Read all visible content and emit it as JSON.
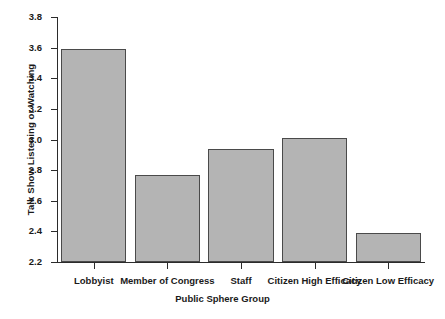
{
  "chart_data": {
    "type": "bar",
    "title": "",
    "xlabel": "Public Sphere Group",
    "ylabel": "Talk Show Listening or Watching",
    "categories": [
      "Lobbyist",
      "Member of Congress",
      "Staff",
      "Citizen High Efficacy",
      "Citizen Low Efficacy"
    ],
    "values": [
      3.59,
      2.77,
      2.94,
      3.01,
      2.39
    ],
    "ylim": [
      2.2,
      3.8
    ],
    "yticks": [
      "2.2",
      "2.4",
      "2.6",
      "2.8",
      "3.0",
      "3.2",
      "3.4",
      "3.6",
      "3.8"
    ],
    "ytick_values": [
      2.2,
      2.4,
      2.6,
      2.8,
      3.0,
      3.2,
      3.4,
      3.6,
      3.8
    ],
    "grid": false,
    "legend": "none",
    "bar_color": "#b4b4b4",
    "bar_edge_color": "#4a4a4a",
    "axis_color": "#2b2b2b",
    "background_color": "#ffffff"
  }
}
